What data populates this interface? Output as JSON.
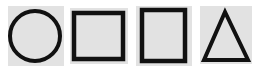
{
  "shapes": [
    {
      "name": "circle",
      "stroke": "#111111",
      "fill": "#e2e2e2"
    },
    {
      "name": "square",
      "stroke": "#111111",
      "fill": "#e2e2e2"
    },
    {
      "name": "square",
      "stroke": "#111111",
      "fill": "#e2e2e2"
    },
    {
      "name": "triangle",
      "stroke": "#111111",
      "fill": "#e2e2e2"
    }
  ],
  "colors": {
    "background": "#ffffff",
    "tile": "#e2e2e2",
    "stroke": "#111111"
  }
}
